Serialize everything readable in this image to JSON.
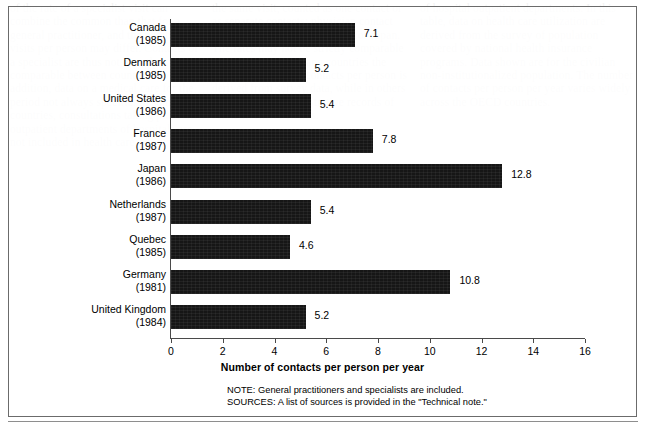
{
  "ghost_text": {
    "left_column": "of the rate of a specialist visit can combine the common than that for a general practitioner, and the number of visits per person may differ. Contacts of a specialist are thus not directly comparable between countries. In addition, data on a medical care for the period not always specific. In some countries, consultations taking place in outpatient departments of hospitals are not included in health care.",
    "middle_column": "the same visit, counted as one contact or as separate contacts; physician contact rates may be under a higher g for Japan. The rates may not be strictly comparable across nations. In many countries the reported number of contacts per person is derived from survey data, while in others it is based on administrative records of reimbursement claims.",
    "right_column": "of hospital outpatient departments. In this table, data on health care utilization are derived from the survey of population covered by national health insurance programs. Data shown are for the civilian non-institutionalized population. The number of contacts per person per year varies widely across the OECD countries."
  },
  "chart_data": {
    "type": "bar",
    "orientation": "horizontal",
    "title": "",
    "xlabel": "Number of contacts per person per year",
    "ylabel": "",
    "xlim": [
      0,
      16
    ],
    "xticks": [
      0,
      2,
      4,
      6,
      8,
      10,
      12,
      14,
      16
    ],
    "grid": false,
    "legend": null,
    "bar_color": "#161616",
    "categories": [
      {
        "name": "Canada",
        "year": "(1985)",
        "value": 7.1,
        "label": "7.1"
      },
      {
        "name": "Denmark",
        "year": "(1985)",
        "value": 5.2,
        "label": "5.2"
      },
      {
        "name": "United States",
        "year": "(1986)",
        "value": 5.4,
        "label": "5.4"
      },
      {
        "name": "France",
        "year": "(1987)",
        "value": 7.8,
        "label": "7.8"
      },
      {
        "name": "Japan",
        "year": "(1986)",
        "value": 12.8,
        "label": "12.8"
      },
      {
        "name": "Netherlands",
        "year": "(1987)",
        "value": 5.4,
        "label": "5.4"
      },
      {
        "name": "Quebec",
        "year": "(1985)",
        "value": 4.6,
        "label": "4.6"
      },
      {
        "name": "Germany",
        "year": "(1981)",
        "value": 10.8,
        "label": "10.8"
      },
      {
        "name": "United Kingdom",
        "year": "(1984)",
        "value": 5.2,
        "label": "5.2"
      }
    ],
    "annotations": [
      "NOTE:  General practitioners and specialists are included.",
      "SOURCES:  A list of sources is provided in the \"Technical note.\""
    ]
  },
  "notes": {
    "note": "NOTE:  General practitioners and specialists are included.",
    "sources": "SOURCES:  A list of sources is provided in the \"Technical note.\""
  }
}
